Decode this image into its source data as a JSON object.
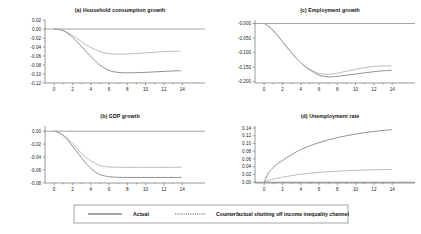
{
  "figure": {
    "background": "#ffffff",
    "line_colors": {
      "actual": "#7d7d7d",
      "counterfactual": "#a8a8a8"
    }
  },
  "legend": {
    "position": "bottom-center",
    "entries": [
      {
        "label": "Actual",
        "style": "solid"
      },
      {
        "label": "Counterfactual shutting off income inequality channel",
        "style": "dotted"
      }
    ]
  },
  "chart_data": [
    {
      "type": "line",
      "panel": "a",
      "title": "(a) Household consumption growth",
      "xlabel": "",
      "ylabel": "",
      "xlim": [
        -1,
        15.4
      ],
      "ylim": [
        -0.12,
        0.02
      ],
      "xticks": [
        0,
        2,
        4,
        6,
        8,
        10,
        12,
        14
      ],
      "xticklabels": [
        "0",
        "2",
        "4",
        "6",
        "8",
        "10",
        "12",
        "14"
      ],
      "yticks": [
        0.02,
        0.0,
        -0.02,
        -0.04,
        -0.06,
        -0.08,
        -0.1,
        -0.12
      ],
      "yticklabels": [
        "0.02",
        "0.00",
        "-0.02",
        "-0.04",
        "-0.06",
        "-0.08",
        "-0.10",
        "-0.12"
      ],
      "grid": false,
      "x": [
        0,
        0.5,
        1,
        1.5,
        2,
        2.5,
        3,
        3.5,
        4,
        4.5,
        5,
        5.5,
        6,
        6.5,
        7,
        7.5,
        8,
        9,
        10,
        11,
        12,
        13,
        13.8
      ],
      "series": [
        {
          "name": "Actual",
          "style": "solid",
          "values": [
            0.0,
            -0.001,
            -0.004,
            -0.01,
            -0.018,
            -0.028,
            -0.039,
            -0.05,
            -0.061,
            -0.071,
            -0.08,
            -0.087,
            -0.092,
            -0.095,
            -0.0965,
            -0.0972,
            -0.0973,
            -0.097,
            -0.0963,
            -0.0953,
            -0.0942,
            -0.0932,
            -0.0928
          ]
        },
        {
          "name": "Counterfactual shutting off income inequality channel",
          "style": "dotted",
          "values": [
            0.0,
            -0.001,
            -0.003,
            -0.008,
            -0.014,
            -0.021,
            -0.028,
            -0.035,
            -0.041,
            -0.046,
            -0.05,
            -0.053,
            -0.0548,
            -0.0557,
            -0.056,
            -0.0559,
            -0.0556,
            -0.0545,
            -0.0532,
            -0.0518,
            -0.0505,
            -0.0496,
            -0.0492
          ]
        }
      ]
    },
    {
      "type": "line",
      "panel": "b",
      "title": "(b) GDP growth",
      "xlabel": "",
      "ylabel": "",
      "xlim": [
        -1,
        15.4
      ],
      "ylim": [
        -0.08,
        0.008
      ],
      "xticks": [
        0,
        2,
        4,
        6,
        8,
        10,
        12,
        14
      ],
      "xticklabels": [
        "0",
        "2",
        "4",
        "6",
        "8",
        "10",
        "12",
        "14"
      ],
      "yticks": [
        0.0,
        -0.02,
        -0.04,
        -0.06,
        -0.08
      ],
      "yticklabels": [
        "0.00",
        "-0.02",
        "-0.04",
        "-0.06",
        "-0.08"
      ],
      "grid": false,
      "x": [
        0,
        0.5,
        1,
        1.5,
        2,
        2.5,
        3,
        3.5,
        4,
        4.5,
        5,
        5.5,
        6,
        7,
        8,
        9,
        10,
        11,
        12,
        13,
        13.9
      ],
      "series": [
        {
          "name": "Actual",
          "style": "solid",
          "values": [
            0.0,
            -0.002,
            -0.007,
            -0.014,
            -0.023,
            -0.032,
            -0.041,
            -0.05,
            -0.057,
            -0.063,
            -0.067,
            -0.069,
            -0.0703,
            -0.0712,
            -0.0714,
            -0.0714,
            -0.0714,
            -0.0714,
            -0.0714,
            -0.0714,
            -0.0714
          ]
        },
        {
          "name": "Counterfactual shutting off income inequality channel",
          "style": "dotted",
          "values": [
            0.0,
            -0.002,
            -0.006,
            -0.012,
            -0.019,
            -0.027,
            -0.034,
            -0.041,
            -0.046,
            -0.05,
            -0.053,
            -0.0545,
            -0.0552,
            -0.0557,
            -0.0557,
            -0.0557,
            -0.0557,
            -0.0557,
            -0.0557,
            -0.0557,
            -0.0557
          ]
        }
      ]
    },
    {
      "type": "line",
      "panel": "c",
      "title": "(c) Employment growth",
      "xlabel": "",
      "ylabel": "",
      "xlim": [
        -1,
        15.4
      ],
      "ylim": [
        -0.205,
        0.012
      ],
      "xticks": [
        0,
        2,
        4,
        6,
        8,
        10,
        12,
        14
      ],
      "xticklabels": [
        "0",
        "2",
        "4",
        "6",
        "8",
        "10",
        "12",
        "14"
      ],
      "yticks": [
        0.0,
        -0.05,
        -0.1,
        -0.15,
        -0.2
      ],
      "yticklabels": [
        "-0.000",
        "-0.050",
        "-0.100",
        "-0.150",
        "-0.200"
      ],
      "grid": false,
      "x": [
        0,
        0.5,
        1,
        1.5,
        2,
        2.5,
        3,
        3.5,
        4,
        4.5,
        5,
        5.5,
        6,
        6.5,
        7,
        7.5,
        8,
        9,
        10,
        11,
        12,
        13,
        13.9
      ],
      "series": [
        {
          "name": "Actual",
          "style": "solid",
          "values": [
            0.0,
            -0.01,
            -0.025,
            -0.043,
            -0.062,
            -0.082,
            -0.101,
            -0.119,
            -0.135,
            -0.149,
            -0.16,
            -0.17,
            -0.178,
            -0.182,
            -0.184,
            -0.1835,
            -0.182,
            -0.178,
            -0.174,
            -0.17,
            -0.166,
            -0.163,
            -0.1615
          ]
        },
        {
          "name": "Counterfactual shutting off income inequality channel",
          "style": "dotted",
          "values": [
            0.0,
            -0.01,
            -0.025,
            -0.043,
            -0.062,
            -0.082,
            -0.101,
            -0.119,
            -0.135,
            -0.148,
            -0.158,
            -0.166,
            -0.172,
            -0.1745,
            -0.175,
            -0.1735,
            -0.171,
            -0.1645,
            -0.158,
            -0.152,
            -0.148,
            -0.1462,
            -0.1458
          ]
        }
      ]
    },
    {
      "type": "line",
      "panel": "d",
      "title": "(d) Unemployment rate",
      "xlabel": "",
      "ylabel": "",
      "xlim": [
        -1,
        15.4
      ],
      "ylim": [
        -0.002,
        0.145
      ],
      "xticks": [
        0,
        2,
        4,
        6,
        8,
        10,
        12,
        14
      ],
      "xticklabels": [
        "0",
        "2",
        "4",
        "6",
        "8",
        "10",
        "12",
        "14"
      ],
      "yticks": [
        0.14,
        0.12,
        0.1,
        0.08,
        0.06,
        0.04,
        0.02,
        0.0
      ],
      "yticklabels": [
        "0.14",
        "0.12",
        "0.10",
        "0.08",
        "0.06",
        "0.04",
        "0.02",
        "0.00"
      ],
      "grid": false,
      "x": [
        0,
        0.4,
        0.8,
        1.2,
        1.6,
        2,
        2.5,
        3,
        3.5,
        4,
        5,
        6,
        7,
        8,
        9,
        10,
        11,
        12,
        13,
        13.9
      ],
      "series": [
        {
          "name": "Actual",
          "style": "solid",
          "values": [
            0.0,
            0.021,
            0.033,
            0.043,
            0.05,
            0.056,
            0.064,
            0.071,
            0.078,
            0.084,
            0.094,
            0.102,
            0.109,
            0.115,
            0.12,
            0.124,
            0.128,
            0.131,
            0.1335,
            0.1352
          ]
        },
        {
          "name": "Counterfactual shutting off income inequality channel",
          "style": "dotted",
          "values": [
            0.0,
            0.004,
            0.007,
            0.009,
            0.011,
            0.013,
            0.0152,
            0.0172,
            0.019,
            0.0205,
            0.0232,
            0.0253,
            0.027,
            0.0284,
            0.0296,
            0.0306,
            0.0314,
            0.0321,
            0.0327,
            0.0331
          ]
        }
      ]
    }
  ]
}
